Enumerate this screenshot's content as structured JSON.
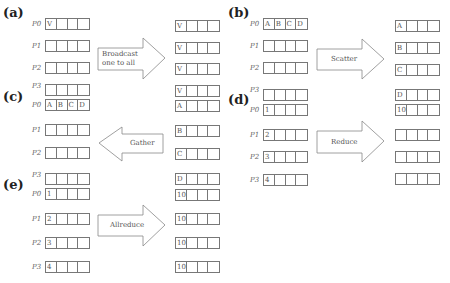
{
  "panels": {
    "a": {
      "label": "(a)",
      "arrow_label": "Broadcast one to all",
      "arrow_label_lines": [
        "Broadcast",
        "one to all"
      ],
      "left": [
        {
          "proc": "P0",
          "cells": [
            "V",
            "",
            "",
            ""
          ]
        },
        {
          "proc": "P1",
          "cells": [
            "",
            "",
            "",
            ""
          ]
        },
        {
          "proc": "P2",
          "cells": [
            "",
            "",
            "",
            ""
          ]
        }
      ],
      "right": [
        {
          "cells": [
            "V",
            "",
            "",
            ""
          ]
        },
        {
          "cells": [
            "V",
            "",
            "",
            ""
          ]
        },
        {
          "cells": [
            "V",
            "",
            "",
            ""
          ]
        },
        {
          "cells": [
            "V",
            "",
            "",
            ""
          ]
        }
      ]
    },
    "b": {
      "label": "(b)",
      "arrow_label": "Scatter",
      "left": [
        {
          "proc": "P0",
          "cells": [
            "A",
            "B",
            "C",
            "D"
          ]
        },
        {
          "proc": "P1",
          "cells": [
            "",
            "",
            "",
            ""
          ]
        },
        {
          "proc": "P2",
          "cells": [
            "",
            "",
            "",
            ""
          ]
        }
      ],
      "right": [
        {
          "cells": [
            "A",
            "",
            "",
            ""
          ]
        },
        {
          "cells": [
            "B",
            "",
            "",
            ""
          ]
        },
        {
          "cells": [
            "C",
            "",
            "",
            ""
          ]
        },
        {
          "cells": [
            "D",
            "",
            "",
            ""
          ]
        }
      ]
    },
    "c": {
      "label": "(c)",
      "arrow_label": "Gather",
      "left": [
        {
          "proc": "P3",
          "cells": [
            "",
            "",
            "",
            ""
          ]
        },
        {
          "proc": "P0",
          "cells": [
            "A",
            "B",
            "C",
            "D"
          ]
        },
        {
          "proc": "P1",
          "cells": [
            "",
            "",
            "",
            ""
          ]
        },
        {
          "proc": "P2",
          "cells": [
            "",
            "",
            "",
            ""
          ]
        }
      ],
      "right": [
        {
          "cells": [
            "A",
            "",
            "",
            ""
          ]
        },
        {
          "cells": [
            "B",
            "",
            "",
            ""
          ]
        },
        {
          "cells": [
            "C",
            "",
            "",
            ""
          ]
        },
        {
          "cells": [
            "D",
            "",
            "",
            ""
          ]
        }
      ]
    },
    "d": {
      "label": "(d)",
      "arrow_label": "Reduce",
      "left": [
        {
          "proc": "P3",
          "cells": [
            "",
            "",
            "",
            ""
          ]
        },
        {
          "proc": "P0",
          "cells": [
            "1",
            "",
            "",
            ""
          ]
        },
        {
          "proc": "P1",
          "cells": [
            "2",
            "",
            "",
            ""
          ]
        },
        {
          "proc": "P2",
          "cells": [
            "3",
            "",
            "",
            ""
          ]
        },
        {
          "proc": "P3",
          "cells": [
            "4",
            "",
            "",
            ""
          ]
        }
      ],
      "right": [
        {
          "cells": [
            "10",
            "",
            "",
            ""
          ]
        },
        {
          "cells": [
            "",
            "",
            "",
            ""
          ]
        },
        {
          "cells": [
            "",
            "",
            "",
            ""
          ]
        },
        {
          "cells": [
            "",
            "",
            "",
            ""
          ]
        }
      ]
    },
    "e": {
      "label": "(e)",
      "arrow_label": "Allreduce",
      "left": [
        {
          "proc": "P3",
          "cells": [
            "",
            "",
            "",
            ""
          ]
        },
        {
          "proc": "P0",
          "cells": [
            "1",
            "",
            "",
            ""
          ]
        },
        {
          "proc": "P1",
          "cells": [
            "2",
            "",
            "",
            ""
          ]
        },
        {
          "proc": "P2",
          "cells": [
            "3",
            "",
            "",
            ""
          ]
        },
        {
          "proc": "P3",
          "cells": [
            "4",
            "",
            "",
            ""
          ]
        }
      ],
      "right": [
        {
          "cells": [
            "10",
            "",
            "",
            ""
          ]
        },
        {
          "cells": [
            "10",
            "",
            "",
            ""
          ]
        },
        {
          "cells": [
            "10",
            "",
            "",
            ""
          ]
        },
        {
          "cells": [
            "10",
            "",
            "",
            ""
          ]
        }
      ]
    }
  }
}
